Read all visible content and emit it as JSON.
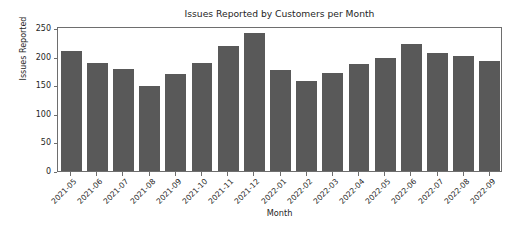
{
  "chart_data": {
    "type": "bar",
    "title": "Issues Reported by Customers per Month",
    "xlabel": "Month",
    "ylabel": "Issues Reported",
    "categories": [
      "2021-05",
      "2021-06",
      "2021-07",
      "2021-08",
      "2021-09",
      "2021-10",
      "2021-11",
      "2021-12",
      "2022-01",
      "2022-02",
      "2022-03",
      "2022-04",
      "2022-05",
      "2022-06",
      "2022-07",
      "2022-08",
      "2022-09"
    ],
    "values": [
      211,
      190,
      180,
      149,
      170,
      190,
      219,
      242,
      178,
      158,
      173,
      188,
      199,
      223,
      208,
      203,
      193
    ],
    "ylim": [
      0,
      255
    ],
    "yticks": [
      0,
      50,
      100,
      150,
      200,
      250
    ],
    "ytick_labels": [
      "0",
      "50",
      "100",
      "150",
      "200",
      "250"
    ],
    "grid": false,
    "legend": null,
    "bar_color": "#595959",
    "axis_color": "#6e6e6e",
    "text_color": "#262626",
    "background_color": "#ffffff",
    "xtick_rotation": -45
  }
}
